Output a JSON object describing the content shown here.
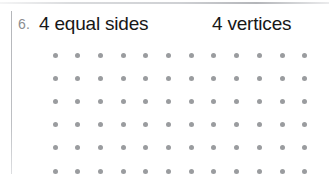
{
  "page": {
    "background_color": "#ffffff",
    "width": 329,
    "height": 177
  },
  "question": {
    "number_label": "6.",
    "number_color": "#8b8d90",
    "attributes": [
      {
        "label": "4 equal sides"
      },
      {
        "label": "4 vertices"
      }
    ],
    "text_color": "#171717"
  },
  "dot_grid": {
    "columns": 12,
    "rows": 6,
    "first_dot_x": 55,
    "first_dot_y": 15,
    "spacing_x": 22.7,
    "spacing_y": 23.2,
    "dot_color": "#9a9c9f",
    "dot_diameter": 5
  },
  "margin_rule": {
    "color": "#b0b2b6"
  }
}
